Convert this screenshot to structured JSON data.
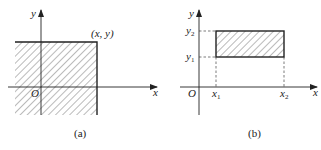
{
  "figure": {
    "panels": [
      {
        "id": "a",
        "caption": "(a)",
        "x_axis_label": "x",
        "y_axis_label": "y",
        "origin_label": "O",
        "point_label": "(x, y)",
        "region": "shaded quadrant to the lower-left of point (x, y)"
      },
      {
        "id": "b",
        "caption": "(b)",
        "x_axis_label": "x",
        "y_axis_label": "y",
        "origin_label": "O",
        "x_ticks": [
          "x1",
          "x2"
        ],
        "y_ticks": [
          "y1",
          "y2"
        ],
        "x_tick_base": "x",
        "y_tick_base": "y",
        "x1_sub": "1",
        "x2_sub": "2",
        "y1_sub": "1",
        "y2_sub": "2",
        "region": "shaded rectangle x1<x≤x2, y1<y≤y2"
      }
    ]
  },
  "colors": {
    "line": "#222222",
    "hatch": "#555555",
    "background": "#ffffff"
  }
}
